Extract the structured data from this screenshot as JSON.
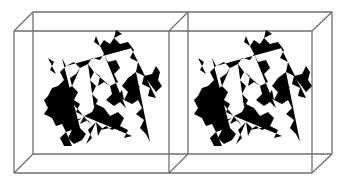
{
  "figure": {
    "description": "Stereo pair of a protein backbone/structure rendered as a stick model inside perspective wireframe boxes",
    "panels": [
      {
        "id": "left",
        "label": ""
      },
      {
        "id": "right",
        "label": ""
      }
    ],
    "colors": {
      "background": "#ffffff",
      "box_edges": "#6e6e6e",
      "molecule": "#1c1c1c"
    }
  }
}
